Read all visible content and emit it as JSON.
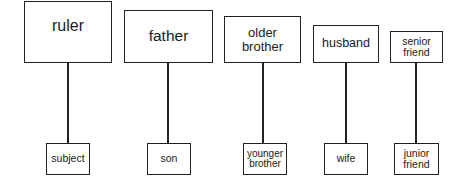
{
  "diagram": {
    "relationships": [
      {
        "superior": "ruler",
        "inferior": "subject"
      },
      {
        "superior": "father",
        "inferior": "son"
      },
      {
        "superior": "older\nbrother",
        "inferior": "younger\nbrother"
      },
      {
        "superior": "husband",
        "inferior": "wife"
      },
      {
        "superior": "senior\nfriend",
        "inferior": "junior\nfriend"
      }
    ]
  }
}
